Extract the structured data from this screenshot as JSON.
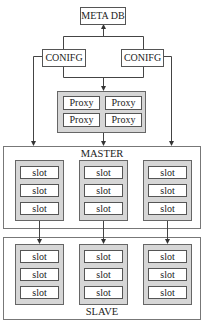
{
  "meta_db": {
    "label": "META DB"
  },
  "configs": [
    {
      "label": "CONIFG"
    },
    {
      "label": "CONIFG"
    }
  ],
  "proxy_group": {
    "cells": [
      {
        "label": "Proxy"
      },
      {
        "label": "Proxy"
      },
      {
        "label": "Proxy"
      },
      {
        "label": "Proxy"
      }
    ]
  },
  "master": {
    "label": "MASTER",
    "columns": [
      {
        "slots": [
          {
            "label": "slot"
          },
          {
            "label": "slot"
          },
          {
            "label": "slot"
          }
        ]
      },
      {
        "slots": [
          {
            "label": "slot"
          },
          {
            "label": "slot"
          },
          {
            "label": "slot"
          }
        ]
      },
      {
        "slots": [
          {
            "label": "slot"
          },
          {
            "label": "slot"
          },
          {
            "label": "slot"
          }
        ]
      }
    ]
  },
  "slave": {
    "label": "SLAVE",
    "columns": [
      {
        "slots": [
          {
            "label": "slot"
          },
          {
            "label": "slot"
          },
          {
            "label": "slot"
          }
        ]
      },
      {
        "slots": [
          {
            "label": "slot"
          },
          {
            "label": "slot"
          },
          {
            "label": "slot"
          }
        ]
      },
      {
        "slots": [
          {
            "label": "slot"
          },
          {
            "label": "slot"
          },
          {
            "label": "slot"
          }
        ]
      }
    ]
  },
  "colors": {
    "line": "#444444",
    "group_fill": "#d6d6d6",
    "background": "#ffffff"
  }
}
